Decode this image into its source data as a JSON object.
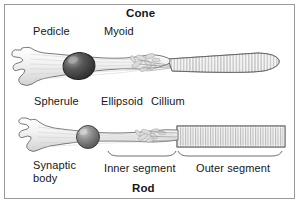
{
  "figure": {
    "type": "anatomical-diagram",
    "background_color": "#ffffff",
    "border_color": "#9a9a9a",
    "text_color": "#161616"
  },
  "titles": {
    "top": "Cone",
    "bottom": "Rod"
  },
  "labels": {
    "pedicle": "Pedicle",
    "myoid": "Myoid",
    "spherule": "Spherule",
    "ellipsoid": "Ellipsoid",
    "cillium": "Cillium",
    "synaptic_body": "Synaptic body",
    "inner_segment": "Inner segment",
    "outer_segment": "Outer segment"
  },
  "cells": {
    "cone": {
      "name": "Cone",
      "parts": [
        "pedicle",
        "nucleus",
        "myoid",
        "ellipsoid",
        "cillium",
        "outer segment"
      ],
      "outer_segment_shape": "tapered cone with stacked discs",
      "nucleus_fill": "#4a4a4a",
      "body_fill": "#f2f2f2"
    },
    "rod": {
      "name": "Rod",
      "parts": [
        "synaptic body",
        "spherule",
        "nucleus",
        "inner segment",
        "ellipsoid",
        "cillium",
        "outer segment"
      ],
      "outer_segment_shape": "straight cylinder with stacked discs",
      "nucleus_fill": "#6e6e6e",
      "body_fill": "#f2f2f2"
    }
  }
}
